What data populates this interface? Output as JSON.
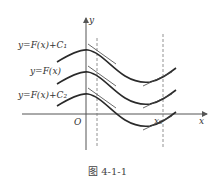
{
  "figure": {
    "caption": "图 4-1-1",
    "axes": {
      "x_label": "x",
      "y_label": "y",
      "origin_label": "O",
      "x0_label": "x₀"
    },
    "curve_labels": [
      "y=F(x)+C₁",
      "y=F(x)",
      "y=F(x)+C₂"
    ],
    "colors": {
      "curve": "#2a2a2a",
      "axis": "#555555",
      "dashed": "#777777",
      "text": "#333333"
    }
  }
}
